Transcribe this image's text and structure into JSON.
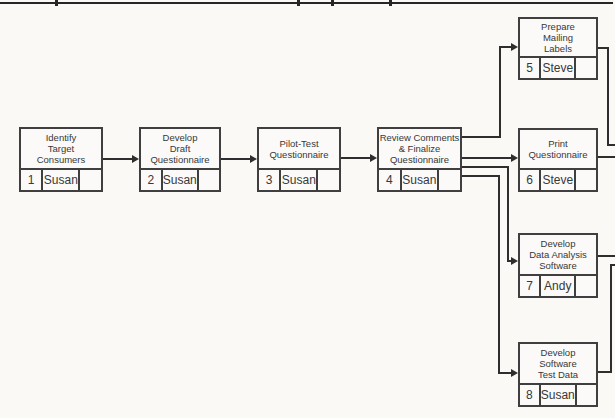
{
  "diagram": {
    "kind": "activity-on-node project network",
    "top_rule_present": true,
    "nodes": [
      {
        "id": 1,
        "title_lines": [
          "Identify",
          "Target",
          "Consumers"
        ],
        "number": "1",
        "owner": "Susan",
        "spare": ""
      },
      {
        "id": 2,
        "title_lines": [
          "Develop",
          "Draft",
          "Questionnaire"
        ],
        "number": "2",
        "owner": "Susan",
        "spare": ""
      },
      {
        "id": 3,
        "title_lines": [
          "Pilot-Test",
          "Questionnaire"
        ],
        "number": "3",
        "owner": "Susan",
        "spare": ""
      },
      {
        "id": 4,
        "title_lines": [
          "Review Comments",
          "& Finalize",
          "Questionnaire"
        ],
        "number": "4",
        "owner": "Susan",
        "spare": ""
      },
      {
        "id": 5,
        "title_lines": [
          "Prepare",
          "Mailing",
          "Labels"
        ],
        "number": "5",
        "owner": "Steve",
        "spare": ""
      },
      {
        "id": 6,
        "title_lines": [
          "Print",
          "Questionnaire"
        ],
        "number": "6",
        "owner": "Steve",
        "spare": ""
      },
      {
        "id": 7,
        "title_lines": [
          "Develop",
          "Data Analysis",
          "Software"
        ],
        "number": "7",
        "owner": "Andy",
        "spare": ""
      },
      {
        "id": 8,
        "title_lines": [
          "Develop",
          "Software",
          "Test Data"
        ],
        "number": "8",
        "owner": "Susan",
        "spare": ""
      }
    ],
    "edges": [
      {
        "from": 1,
        "to": 2
      },
      {
        "from": 2,
        "to": 3
      },
      {
        "from": 3,
        "to": 4
      },
      {
        "from": 4,
        "to": 5
      },
      {
        "from": 4,
        "to": 6
      },
      {
        "from": 4,
        "to": 7
      },
      {
        "from": 4,
        "to": 8
      },
      {
        "from": 5,
        "to": "offscreen-right"
      },
      {
        "from": 6,
        "to": "offscreen-right"
      },
      {
        "from": 7,
        "to": "offscreen-right"
      },
      {
        "from": 8,
        "to": "offscreen-right"
      }
    ],
    "colors": {
      "background": "#faf9f6",
      "box_border": "#3f3f3f",
      "connector": "#2e2e2e",
      "text": "#383838"
    }
  }
}
